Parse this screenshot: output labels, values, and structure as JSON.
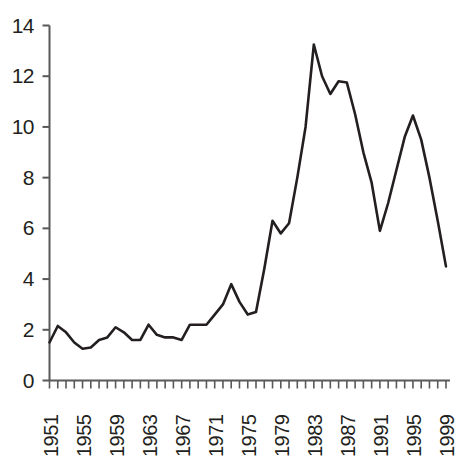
{
  "chart_data": {
    "type": "line",
    "title": "",
    "xlabel": "",
    "ylabel": "",
    "xlim": [
      1951,
      1999
    ],
    "ylim": [
      0,
      14
    ],
    "grid": false,
    "legend": "none",
    "y_ticks": [
      0,
      2,
      4,
      6,
      8,
      10,
      12,
      14
    ],
    "x_tick_labels": [
      "1951",
      "1955",
      "1959",
      "1963",
      "1967",
      "1971",
      "1975",
      "1979",
      "1983",
      "1987",
      "1991",
      "1995",
      "1999"
    ],
    "x_tick_step_years": 4,
    "x_minor_tick_step_years": 1,
    "line_color": "#231f20",
    "axis_color": "#58595b",
    "x": [
      1951,
      1952,
      1953,
      1954,
      1955,
      1956,
      1957,
      1958,
      1959,
      1960,
      1961,
      1962,
      1963,
      1964,
      1965,
      1966,
      1967,
      1968,
      1969,
      1970,
      1971,
      1972,
      1973,
      1974,
      1975,
      1976,
      1977,
      1978,
      1979,
      1980,
      1981,
      1982,
      1983,
      1984,
      1985,
      1986,
      1987,
      1988,
      1989,
      1990,
      1991,
      1992,
      1993,
      1994,
      1995,
      1996,
      1997,
      1998,
      1999
    ],
    "values": [
      1.5,
      2.15,
      1.9,
      1.5,
      1.25,
      1.3,
      1.6,
      1.7,
      2.1,
      1.9,
      1.6,
      1.6,
      2.2,
      1.8,
      1.7,
      1.7,
      1.6,
      2.2,
      2.2,
      2.2,
      2.6,
      3.0,
      3.8,
      3.1,
      2.6,
      2.7,
      4.4,
      6.3,
      5.8,
      6.2,
      8.0,
      10.0,
      13.25,
      12.0,
      11.3,
      11.8,
      11.75,
      10.5,
      9.0,
      7.8,
      5.9,
      7.0,
      8.3,
      9.6,
      10.45,
      9.5,
      8.0,
      6.3,
      4.5
    ]
  },
  "axes": {
    "y_labels": [
      "14",
      "12",
      "10",
      "8",
      "6",
      "4",
      "2",
      "0"
    ],
    "x_labels": [
      "1951",
      "1955",
      "1959",
      "1963",
      "1967",
      "1971",
      "1975",
      "1979",
      "1983",
      "1987",
      "1991",
      "1995",
      "1999"
    ]
  }
}
